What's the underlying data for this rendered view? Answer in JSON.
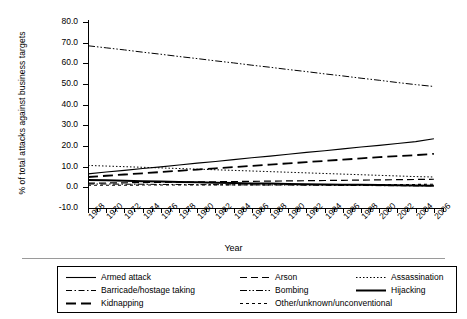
{
  "chart_data": {
    "type": "line",
    "title": "",
    "xlabel": "Year",
    "ylabel": "% of total attacks against business targets",
    "xlim": [
      1968,
      2007
    ],
    "ylim": [
      -10.0,
      80.0
    ],
    "ytick_labels": [
      "80.0",
      "70.0",
      "60.0",
      "50.0",
      "40.0",
      "30.0",
      "20.0",
      "10.0",
      "0.0",
      "-10.0"
    ],
    "ytick_values": [
      80.0,
      70.0,
      60.0,
      50.0,
      40.0,
      30.0,
      20.0,
      10.0,
      0.0,
      -10.0
    ],
    "xtick_labels": [
      "1968",
      "1970",
      "1972",
      "1974",
      "1976",
      "1978",
      "1980",
      "1982",
      "1984",
      "1986",
      "1988",
      "1990",
      "1992",
      "1994",
      "1996",
      "1998",
      "2000",
      "2002",
      "2004",
      "2006"
    ],
    "xtick_values": [
      1968,
      1970,
      1972,
      1974,
      1976,
      1978,
      1980,
      1982,
      1984,
      1986,
      1988,
      1990,
      1992,
      1994,
      1996,
      1998,
      2000,
      2002,
      2004,
      2006
    ],
    "grid": false,
    "legend_position": "below",
    "x": [
      1968,
      1970,
      1972,
      1974,
      1976,
      1978,
      1980,
      1982,
      1984,
      1986,
      1988,
      1990,
      1992,
      1994,
      1996,
      1998,
      2000,
      2002,
      2004,
      2006
    ],
    "series": [
      {
        "name": "Armed attack",
        "style": "solid-thin",
        "values": [
          6.5,
          7.4,
          8.2,
          9.1,
          9.9,
          10.8,
          11.7,
          12.5,
          13.4,
          14.3,
          15.1,
          16.0,
          16.9,
          17.7,
          18.6,
          19.5,
          20.3,
          21.2,
          22.1,
          23.5
        ]
      },
      {
        "name": "Barricade/hostage taking",
        "style": "dash-dot",
        "values": [
          1.6,
          1.6,
          1.5,
          1.5,
          1.4,
          1.4,
          1.3,
          1.3,
          1.2,
          1.2,
          1.1,
          1.1,
          1.0,
          1.0,
          0.9,
          0.9,
          0.8,
          0.8,
          0.7,
          0.7
        ]
      },
      {
        "name": "Kidnapping",
        "style": "long-dash",
        "values": [
          5.0,
          5.6,
          6.2,
          6.8,
          7.4,
          8.0,
          8.6,
          9.2,
          9.8,
          10.4,
          11.0,
          11.6,
          12.2,
          12.8,
          13.4,
          14.0,
          14.6,
          15.1,
          15.6,
          16.2
        ]
      },
      {
        "name": "Arson",
        "style": "medium-dash",
        "values": [
          2.0,
          2.1,
          2.2,
          2.3,
          2.4,
          2.5,
          2.6,
          2.7,
          2.8,
          2.9,
          3.0,
          3.1,
          3.2,
          3.3,
          3.4,
          3.5,
          3.6,
          3.7,
          3.8,
          3.9
        ]
      },
      {
        "name": "Bombing",
        "style": "dash-dot-dot",
        "values": [
          68.5,
          67.5,
          66.5,
          65.4,
          64.4,
          63.3,
          62.3,
          61.2,
          60.2,
          59.1,
          58.1,
          57.0,
          56.0,
          54.9,
          53.9,
          52.8,
          51.8,
          50.7,
          49.7,
          48.8
        ]
      },
      {
        "name": "Other/unknown/unconventional",
        "style": "dotted-dash",
        "values": [
          1.0,
          1.0,
          1.0,
          1.1,
          1.1,
          1.1,
          1.1,
          1.2,
          1.2,
          1.2,
          1.2,
          1.3,
          1.3,
          1.3,
          1.3,
          1.4,
          1.4,
          1.4,
          1.4,
          1.5
        ]
      },
      {
        "name": "Assassination",
        "style": "fine-dot",
        "values": [
          10.6,
          10.3,
          10.0,
          9.7,
          9.4,
          9.1,
          8.8,
          8.5,
          8.2,
          7.9,
          7.6,
          7.3,
          7.0,
          6.7,
          6.4,
          6.1,
          5.8,
          5.5,
          5.2,
          5.0
        ]
      },
      {
        "name": "Hijacking",
        "style": "solid-thick",
        "values": [
          3.6,
          3.4,
          3.2,
          3.0,
          2.8,
          2.6,
          2.4,
          2.2,
          2.1,
          1.9,
          1.8,
          1.6,
          1.5,
          1.4,
          1.3,
          1.2,
          1.1,
          1.0,
          0.9,
          0.8
        ]
      }
    ]
  },
  "legend": {
    "items": [
      {
        "label": "Armed attack",
        "style": "solid-thin"
      },
      {
        "label": "Arson",
        "style": "medium-dash"
      },
      {
        "label": "Assassination",
        "style": "fine-dot"
      },
      {
        "label": "Barricade/hostage taking",
        "style": "dash-dot"
      },
      {
        "label": "Bombing",
        "style": "dash-dot-dot"
      },
      {
        "label": "Hijacking",
        "style": "solid-thick"
      },
      {
        "label": "Kidnapping",
        "style": "long-dash"
      },
      {
        "label": "Other/unknown/unconventional",
        "style": "dotted-dash"
      }
    ]
  },
  "colors": {
    "line": "#000000",
    "axis": "#000000",
    "background": "#ffffff",
    "rule": "#9a9a9a"
  }
}
